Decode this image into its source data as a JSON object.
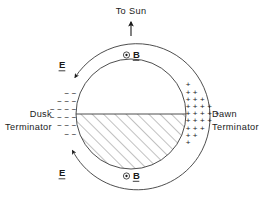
{
  "figure": {
    "background_color": "#ffffff",
    "line_color": "#3a3a3a",
    "text_color": "#1a1a1a",
    "width": 263,
    "height": 197
  },
  "labels": {
    "to_sun": "To Sun",
    "dusk_line1": "Dusk",
    "dusk_line2": "Terminator",
    "dawn_line1": "Dawn",
    "dawn_line2": "Terminator",
    "e_field_upper": "E",
    "e_field_lower": "E",
    "b_field_upper": "B",
    "b_field_lower": "B",
    "b_out_of_page_symbol": "⊙",
    "negative_charge_symbol": "−",
    "positive_charge_symbol": "+"
  },
  "geometry": {
    "center_x": 131,
    "center_y": 114,
    "inner_radius": 55,
    "outer_radius": 73,
    "outer_gap_degrees": 22,
    "hatch_angle_degrees": 45,
    "hatch_spacing_px": 8,
    "equator_line_y": 114
  },
  "charges": {
    "dusk_sign": "−",
    "dusk_rows": [
      2,
      3,
      4,
      4,
      3,
      2
    ],
    "dawn_sign": "+",
    "dawn_rows": [
      1,
      2,
      3,
      4,
      5,
      4,
      3,
      2,
      1
    ],
    "dusk_description": "negative charge layer at dusk terminator",
    "dawn_description": "positive charge layer at dawn terminator"
  },
  "arrows": {
    "sun_direction": "up",
    "e_field_upper_direction": "down-left along outer arc",
    "e_field_lower_direction": "up-left along outer arc",
    "sun_arrow_label": "To Sun"
  },
  "regions": {
    "shaded": "nightside hemisphere (hatched)",
    "unshaded": "dayside hemisphere"
  }
}
